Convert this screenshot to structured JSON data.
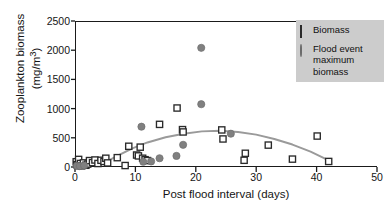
{
  "figure": {
    "name": "zooplankton-biomass-scatter"
  },
  "chart_data": {
    "type": "scatter",
    "title": "",
    "xlabel": "Post flood interval (days)",
    "ylabel_line1": "Zooplankton biomass",
    "ylabel_line2": "(mg/m3)",
    "ylabel_line2_base": "(mg/m",
    "ylabel_line2_sup": "3",
    "ylabel_line2_close": ")",
    "xlim": [
      0,
      50
    ],
    "ylim": [
      0,
      2500
    ],
    "xticks": [
      0,
      10,
      20,
      30,
      40,
      50
    ],
    "yticks": [
      0,
      500,
      1000,
      1500,
      2000,
      2500
    ],
    "grid": false,
    "legend_position": "top-right",
    "series": [
      {
        "name": "Biomass",
        "marker": "open-square",
        "color": "#2a2a2a",
        "points": [
          {
            "x": 0.2,
            "y": 90
          },
          {
            "x": 0.3,
            "y": 40
          },
          {
            "x": 0.5,
            "y": 25
          },
          {
            "x": 0.6,
            "y": 130
          },
          {
            "x": 0.9,
            "y": 60
          },
          {
            "x": 1.1,
            "y": 20
          },
          {
            "x": 1.4,
            "y": 70
          },
          {
            "x": 1.8,
            "y": 30
          },
          {
            "x": 2.1,
            "y": 50
          },
          {
            "x": 2.4,
            "y": 110
          },
          {
            "x": 2.9,
            "y": 75
          },
          {
            "x": 3.3,
            "y": 120
          },
          {
            "x": 3.8,
            "y": 60
          },
          {
            "x": 4.3,
            "y": 115
          },
          {
            "x": 4.8,
            "y": 95
          },
          {
            "x": 5.1,
            "y": 150
          },
          {
            "x": 5.4,
            "y": 70
          },
          {
            "x": 7.0,
            "y": 160
          },
          {
            "x": 8.3,
            "y": 25
          },
          {
            "x": 8.9,
            "y": 355
          },
          {
            "x": 10.2,
            "y": 205
          },
          {
            "x": 10.5,
            "y": 190
          },
          {
            "x": 10.8,
            "y": 340
          },
          {
            "x": 11.2,
            "y": 150
          },
          {
            "x": 11.6,
            "y": 125
          },
          {
            "x": 12.0,
            "y": 110
          },
          {
            "x": 14.0,
            "y": 730
          },
          {
            "x": 16.9,
            "y": 1010
          },
          {
            "x": 17.8,
            "y": 640
          },
          {
            "x": 17.9,
            "y": 600
          },
          {
            "x": 24.3,
            "y": 635
          },
          {
            "x": 24.5,
            "y": 480
          },
          {
            "x": 28.0,
            "y": 115
          },
          {
            "x": 28.2,
            "y": 235
          },
          {
            "x": 32.0,
            "y": 375
          },
          {
            "x": 36.0,
            "y": 135
          },
          {
            "x": 40.1,
            "y": 530
          },
          {
            "x": 42.0,
            "y": 95
          }
        ]
      },
      {
        "name": "Flood event maximum biomass",
        "marker": "filled-circle",
        "color": "#808080",
        "points": [
          {
            "x": 0.3,
            "y": 20
          },
          {
            "x": 0.8,
            "y": 15
          },
          {
            "x": 1.5,
            "y": 25
          },
          {
            "x": 11.0,
            "y": 690
          },
          {
            "x": 11.3,
            "y": 90
          },
          {
            "x": 12.6,
            "y": 95
          },
          {
            "x": 14.0,
            "y": 150
          },
          {
            "x": 16.8,
            "y": 190
          },
          {
            "x": 17.9,
            "y": 380
          },
          {
            "x": 20.9,
            "y": 2040
          },
          {
            "x": 20.9,
            "y": 1075
          },
          {
            "x": 25.8,
            "y": 570
          }
        ]
      }
    ],
    "trend_line": {
      "name": "fitted quadratic trend",
      "color": "#9a9a9a",
      "points": [
        {
          "x": 4.6,
          "y": 60
        },
        {
          "x": 7.0,
          "y": 190
        },
        {
          "x": 9.5,
          "y": 320
        },
        {
          "x": 12.0,
          "y": 420
        },
        {
          "x": 15.0,
          "y": 510
        },
        {
          "x": 18.0,
          "y": 570
        },
        {
          "x": 21.0,
          "y": 610
        },
        {
          "x": 24.0,
          "y": 620
        },
        {
          "x": 27.0,
          "y": 600
        },
        {
          "x": 30.0,
          "y": 555
        },
        {
          "x": 33.0,
          "y": 480
        },
        {
          "x": 36.0,
          "y": 385
        },
        {
          "x": 39.0,
          "y": 265
        },
        {
          "x": 42.0,
          "y": 115
        }
      ]
    }
  },
  "legend": {
    "items": [
      {
        "label": "Biomass",
        "marker": "open-square"
      },
      {
        "label": "Flood event maximum biomass",
        "marker": "filled-circle"
      }
    ],
    "item1_label": "Biomass",
    "item2_label": "Flood event maximum biomass",
    "background": "#cccccc"
  },
  "colors": {
    "axis": "#1a1a1a",
    "square_marker": "#2a2a2a",
    "circle_marker": "#808080",
    "trend": "#9a9a9a",
    "legend_bg": "#cccccc",
    "text": "#151515"
  }
}
